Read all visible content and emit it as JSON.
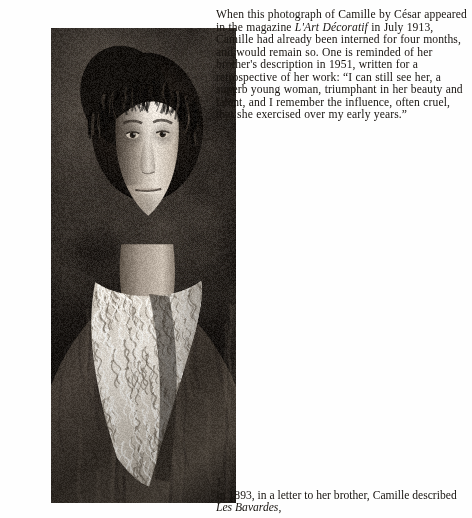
{
  "page": {
    "background_color": "#fefefe",
    "text_color": "#17130f"
  },
  "photograph": {
    "alt_description": "Black-and-white vintage portrait photograph of a young woman with dark upswept hair, facing the camera, wearing a dark garment with an elaborate white lace collar",
    "subject": "Camille",
    "photographer": "César",
    "tone_colors": {
      "deep_shadow": "#0e0c0a",
      "mid_shadow": "#3a342e",
      "skin_midtone": "#b9ada0",
      "skin_highlight": "#e3dbd0",
      "lace_highlight": "#efe9e0"
    }
  },
  "body_text": {
    "segments": [
      {
        "text": "When this photograph of Camille by César appeared in the magazine ",
        "style": "roman"
      },
      {
        "text": "L'Art Décoratif",
        "style": "italic"
      },
      {
        "text": " in July 1913, Camille had already been interned for four months, and would remain so. One is reminded of her brother's description in 1951, written for a retrospective of her work: “I can still see her, a superb young woman, triumphant in her beauty and talent, and I remember the influence, often cruel, that she exercised over my early years.”",
        "style": "roman"
      }
    ],
    "plain": "When this photograph of Camille by César appeared in the magazine L'Art Décoratif in July 1913, Camille had already been interned for four months, and would remain so. One is reminded of her brother's description in 1951, written for a retrospective of her work: “I can still see her, a superb young woman, triumphant in her beauty and talent, and I remember the influence, often cruel, that she exercised over my early years.”"
  },
  "figure": {
    "number": "1",
    "caption_segments": [
      {
        "text": "In 1893, in a letter to her brother, Camille described ",
        "style": "roman"
      },
      {
        "text": "Les Bavardes",
        "style": "italic"
      },
      {
        "text": ",",
        "style": "roman"
      }
    ],
    "caption_plain": "In 1893, in a letter to her brother, Camille described Les Bavardes,"
  }
}
